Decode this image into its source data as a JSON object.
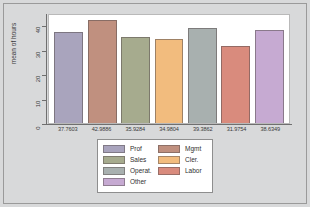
{
  "chart_data": {
    "type": "bar",
    "title": "",
    "xlabel": "",
    "ylabel": "mean of hours",
    "ylim": [
      0,
      45
    ],
    "yticks": [
      0,
      10,
      20,
      30,
      40
    ],
    "ytick_labels": [
      "0",
      "10",
      "20",
      "30",
      "40"
    ],
    "grid": false,
    "legend_position": "bottom",
    "categories": [
      "Prof",
      "Mgmt",
      "Sales",
      "Cler.",
      "Operat.",
      "Labor",
      "Other"
    ],
    "values": [
      37.7603,
      42.9886,
      35.9284,
      34.9804,
      39.3862,
      31.9754,
      38.6349
    ],
    "xtick_labels": [
      "37.7603",
      "42.9886",
      "35.9284",
      "34.9804",
      "39.3862",
      "31.9754",
      "38.6349"
    ],
    "bar_colors": [
      "#a9a4bd",
      "#c0907f",
      "#a6ab8e",
      "#f2bc7e",
      "#a8b0af",
      "#d98b7d",
      "#c6aad2"
    ],
    "bars": [
      {
        "label": "Prof",
        "value": 37.7603,
        "xtick": "37.7603",
        "color": "#a9a4bd"
      },
      {
        "label": "Mgmt",
        "value": 42.9886,
        "xtick": "42.9886",
        "color": "#c0907f"
      },
      {
        "label": "Sales",
        "value": 35.9284,
        "xtick": "35.9284",
        "color": "#a6ab8e"
      },
      {
        "label": "Cler.",
        "value": 34.9804,
        "xtick": "34.9804",
        "color": "#f2bc7e"
      },
      {
        "label": "Operat.",
        "value": 39.3862,
        "xtick": "39.3862",
        "color": "#a8b0af"
      },
      {
        "label": "Labor",
        "value": 31.9754,
        "xtick": "31.9754",
        "color": "#d98b7d"
      },
      {
        "label": "Other",
        "value": 38.6349,
        "xtick": "38.6349",
        "color": "#c6aad2"
      }
    ]
  },
  "axes": {
    "y_title": "mean of hours",
    "y_ticks": [
      {
        "label": "40",
        "value": 40
      },
      {
        "label": "30",
        "value": 30
      },
      {
        "label": "20",
        "value": 20
      },
      {
        "label": "10",
        "value": 10
      },
      {
        "label": "0",
        "value": 0
      }
    ]
  },
  "legend": {
    "left_column": [
      {
        "label": "Prof",
        "color": "#a9a4bd"
      },
      {
        "label": "Sales",
        "color": "#a6ab8e"
      },
      {
        "label": "Operat.",
        "color": "#a8b0af"
      },
      {
        "label": "Other",
        "color": "#c6aad2"
      }
    ],
    "right_column": [
      {
        "label": "Mgmt",
        "color": "#c0907f"
      },
      {
        "label": "Cler.",
        "color": "#f2bc7e"
      },
      {
        "label": "Labor",
        "color": "#d98b7d"
      }
    ]
  },
  "colors": {
    "figure_background": "#d8d9da",
    "plot_background": "#ffffff",
    "axis_line": "#6f6f6f",
    "text": "#3a3a3a"
  }
}
